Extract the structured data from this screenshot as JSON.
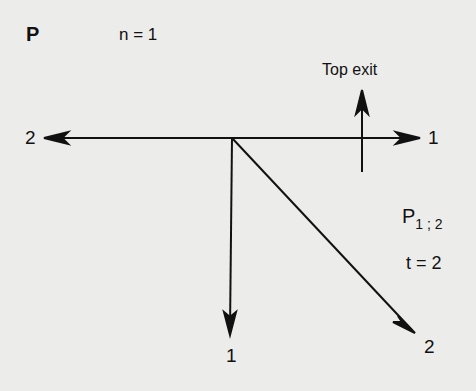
{
  "diagram": {
    "title": "P",
    "n_label": "n = 1",
    "top_exit_label": "Top exit",
    "arrows": [
      {
        "direction": "left",
        "end_label": "2"
      },
      {
        "direction": "right",
        "end_label": "1"
      },
      {
        "direction": "down",
        "end_label": "1"
      },
      {
        "direction": "down-right",
        "end_label": "2"
      },
      {
        "direction": "up",
        "label": "Top exit"
      }
    ],
    "p_label_base": "P",
    "p_label_sub": "1 ; 2",
    "t_label": "t = 2"
  }
}
